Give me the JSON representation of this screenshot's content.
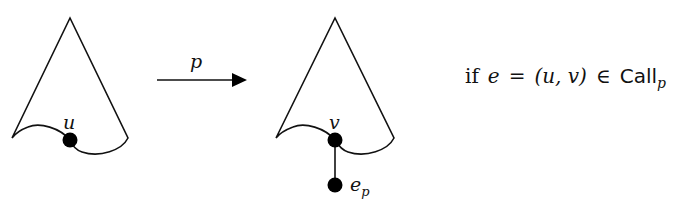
{
  "diagram": {
    "left_tree": {
      "node_label": "u"
    },
    "arrow": {
      "label": "p"
    },
    "right_tree": {
      "node_label": "v",
      "child_label_base": "e",
      "child_label_sub": "p"
    },
    "condition": {
      "prefix": "if",
      "var_e": "e",
      "equals": "=",
      "pair": "(u, v)",
      "member": "∈",
      "set_name": "Call",
      "set_sub": "p"
    }
  },
  "colors": {
    "stroke": "#111111",
    "background": "#ffffff"
  }
}
